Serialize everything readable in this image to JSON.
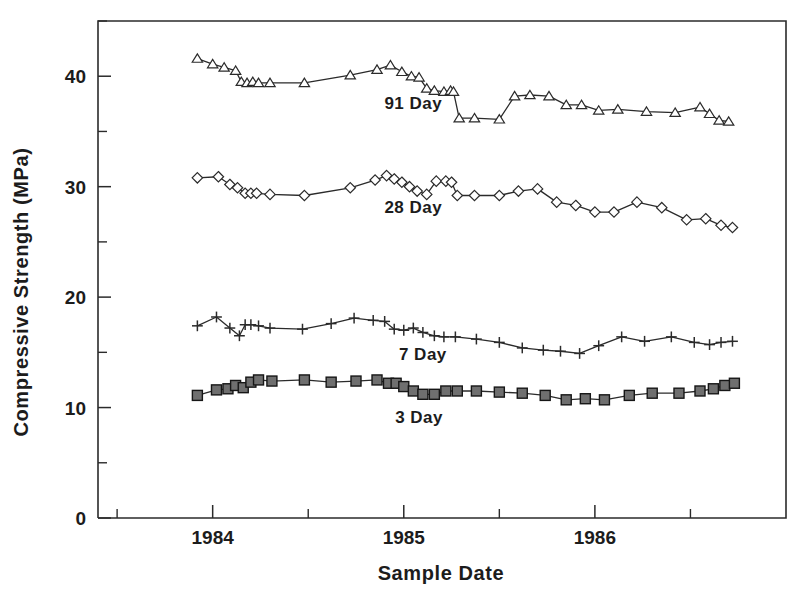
{
  "chart_data": {
    "type": "line",
    "title": "",
    "xlabel": "Sample  Date",
    "ylabel": "Compressive  Strength  (MPa)",
    "xlim": [
      1983.4,
      1987.0
    ],
    "ylim": [
      0,
      45
    ],
    "grid": false,
    "legend_position": "inline-annotations",
    "y_ticks_major": [
      0,
      10,
      20,
      30,
      40
    ],
    "y_ticks_minor": [
      5,
      15,
      25,
      35,
      45
    ],
    "y_ticklabels": [
      "0",
      "10",
      "20",
      "30",
      "40"
    ],
    "x_ticks_major": [
      1984,
      1985,
      1986
    ],
    "x_ticks_minor": [
      1983.5,
      1984.5,
      1985.5,
      1986.5
    ],
    "x_ticklabels": [
      "1984",
      "1985",
      "1986"
    ],
    "series": [
      {
        "name": "91 Day",
        "label": "91  Day",
        "marker": "triangle-open",
        "color": "#2b2b2b",
        "label_x": 1985.05,
        "label_y": 37.0,
        "x": [
          1983.92,
          1984.0,
          1984.06,
          1984.12,
          1984.15,
          1984.18,
          1984.21,
          1984.24,
          1984.3,
          1984.48,
          1984.72,
          1984.86,
          1984.93,
          1984.99,
          1985.04,
          1985.08,
          1985.12,
          1985.16,
          1985.21,
          1985.245,
          1985.26,
          1985.29,
          1985.37,
          1985.5,
          1985.58,
          1985.66,
          1985.76,
          1985.85,
          1985.93,
          1986.02,
          1986.12,
          1986.27,
          1986.42,
          1986.55,
          1986.6,
          1986.65,
          1986.7
        ],
        "y": [
          41.6,
          41.1,
          40.8,
          40.5,
          39.5,
          39.4,
          39.5,
          39.4,
          39.4,
          39.4,
          40.1,
          40.6,
          41.0,
          40.4,
          40.0,
          39.9,
          38.9,
          38.7,
          38.6,
          38.7,
          38.6,
          36.2,
          36.2,
          36.1,
          38.2,
          38.3,
          38.2,
          37.4,
          37.4,
          36.9,
          37.0,
          36.8,
          36.7,
          37.2,
          36.6,
          36.0,
          35.9
        ],
        "units": "MPa"
      },
      {
        "name": "28 Day",
        "label": "28  Day",
        "marker": "diamond-open",
        "color": "#2b2b2b",
        "label_x": 1985.05,
        "label_y": 27.6,
        "x": [
          1983.92,
          1984.03,
          1984.09,
          1984.13,
          1984.17,
          1984.2,
          1984.23,
          1984.3,
          1984.48,
          1984.72,
          1984.85,
          1984.91,
          1984.95,
          1984.99,
          1985.03,
          1985.07,
          1985.12,
          1985.17,
          1985.22,
          1985.25,
          1985.28,
          1985.37,
          1985.5,
          1985.6,
          1985.7,
          1985.8,
          1985.9,
          1986.0,
          1986.1,
          1986.22,
          1986.35,
          1986.48,
          1986.58,
          1986.66,
          1986.72
        ],
        "y": [
          30.8,
          30.9,
          30.2,
          29.9,
          29.4,
          29.4,
          29.4,
          29.3,
          29.2,
          29.9,
          30.6,
          31.0,
          30.7,
          30.4,
          30.0,
          29.6,
          29.3,
          30.5,
          30.5,
          30.4,
          29.2,
          29.2,
          29.2,
          29.6,
          29.8,
          28.6,
          28.3,
          27.7,
          27.7,
          28.6,
          28.1,
          27.0,
          27.1,
          26.5,
          26.3
        ],
        "units": "MPa"
      },
      {
        "name": "7 Day",
        "label": "7  Day",
        "marker": "plus",
        "color": "#2b2b2b",
        "label_x": 1985.1,
        "label_y": 14.3,
        "x": [
          1983.92,
          1984.02,
          1984.09,
          1984.14,
          1984.17,
          1984.2,
          1984.24,
          1984.3,
          1984.47,
          1984.62,
          1984.74,
          1984.84,
          1984.9,
          1984.95,
          1985.0,
          1985.05,
          1985.1,
          1985.16,
          1985.21,
          1985.27,
          1985.38,
          1985.5,
          1985.62,
          1985.73,
          1985.82,
          1985.92,
          1986.02,
          1986.14,
          1986.26,
          1986.4,
          1986.52,
          1986.6,
          1986.66,
          1986.72
        ],
        "y": [
          17.4,
          18.2,
          17.2,
          16.5,
          17.5,
          17.5,
          17.4,
          17.2,
          17.1,
          17.6,
          18.1,
          17.9,
          17.8,
          17.1,
          17.0,
          17.2,
          16.8,
          16.5,
          16.4,
          16.4,
          16.2,
          15.9,
          15.4,
          15.2,
          15.1,
          14.9,
          15.6,
          16.4,
          16.0,
          16.4,
          15.9,
          15.7,
          15.9,
          16.0
        ],
        "units": "MPa"
      },
      {
        "name": "3 Day",
        "label": "3  Day",
        "marker": "square-filled",
        "color": "#6f6f6f",
        "label_x": 1985.08,
        "label_y": 8.6,
        "x": [
          1983.92,
          1984.02,
          1984.08,
          1984.12,
          1984.16,
          1984.2,
          1984.24,
          1984.31,
          1984.48,
          1984.62,
          1984.75,
          1984.86,
          1984.92,
          1984.96,
          1985.0,
          1985.05,
          1985.1,
          1985.16,
          1985.22,
          1985.28,
          1985.38,
          1985.5,
          1985.62,
          1985.74,
          1985.85,
          1985.95,
          1986.05,
          1986.18,
          1986.3,
          1986.44,
          1986.55,
          1986.62,
          1986.68,
          1986.73
        ],
        "y": [
          11.1,
          11.6,
          11.7,
          12.0,
          11.8,
          12.3,
          12.5,
          12.4,
          12.5,
          12.3,
          12.4,
          12.5,
          12.2,
          12.2,
          11.9,
          11.5,
          11.2,
          11.2,
          11.5,
          11.5,
          11.5,
          11.4,
          11.3,
          11.1,
          10.7,
          10.8,
          10.7,
          11.1,
          11.3,
          11.3,
          11.5,
          11.7,
          12.0,
          12.2
        ],
        "units": "MPa"
      }
    ]
  },
  "axes": {
    "ylabel": "Compressive  Strength  (MPa)",
    "xlabel": "Sample  Date"
  }
}
